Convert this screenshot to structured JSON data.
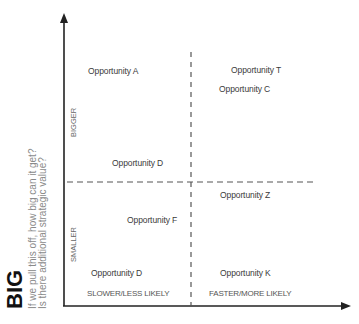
{
  "y_axis": {
    "title": "BIG",
    "subtitle_line1": "If we pull this off, how big can it get?",
    "subtitle_line2": "Is there additional strategic value?",
    "upper_label": "BIGGER",
    "lower_label": "SMALLER"
  },
  "x_axis": {
    "left_label": "SLOWER/LESS LIKELY",
    "right_label": "FASTER/MORE LIKELY"
  },
  "opportunities": [
    {
      "label": "Opportunity A",
      "quadrant": "top-left"
    },
    {
      "label": "Opportunity T",
      "quadrant": "top-right"
    },
    {
      "label": "Opportunity C",
      "quadrant": "top-right"
    },
    {
      "label": "Opportunity D",
      "quadrant": "top-left"
    },
    {
      "label": "Opportunity Z",
      "quadrant": "bottom-right"
    },
    {
      "label": "Opportunity F",
      "quadrant": "bottom-left"
    },
    {
      "label": "Opportunity D",
      "quadrant": "bottom-left"
    },
    {
      "label": "Opportunity K",
      "quadrant": "bottom-right"
    }
  ],
  "colors": {
    "axis": "#222222",
    "dash": "#555555",
    "text": "#3a3a3a",
    "subtitle": "#8a8a8a"
  }
}
